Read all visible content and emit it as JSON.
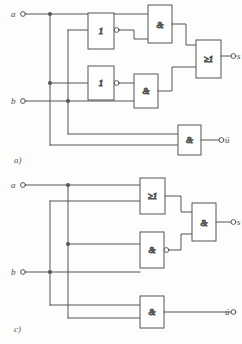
{
  "page": {
    "background_color": "#fdfdfc",
    "line_color": "#555555",
    "gate_fill": "#ffffff"
  },
  "figures": [
    {
      "id": "a",
      "caption": "a)",
      "inputs": [
        {
          "name": "input-a",
          "label": "a"
        },
        {
          "name": "input-b",
          "label": "b"
        }
      ],
      "outputs": [
        {
          "name": "output-s",
          "label": "s"
        },
        {
          "name": "output-ue",
          "label": "ü"
        }
      ],
      "gates": [
        {
          "name": "not-gate-1",
          "symbol": "1",
          "type": "NOT",
          "inverted_output": true
        },
        {
          "name": "and-gate-1",
          "symbol": "&",
          "type": "AND",
          "inverted_output": false
        },
        {
          "name": "not-gate-2",
          "symbol": "1",
          "type": "NOT",
          "inverted_output": true
        },
        {
          "name": "and-gate-2",
          "symbol": "&",
          "type": "AND",
          "inverted_output": false
        },
        {
          "name": "or-gate-1",
          "symbol": "≥1",
          "type": "OR",
          "inverted_output": false
        },
        {
          "name": "and-gate-3",
          "symbol": "&",
          "type": "AND",
          "inverted_output": false
        }
      ]
    },
    {
      "id": "c",
      "caption": "c)",
      "inputs": [
        {
          "name": "input-a",
          "label": "a"
        },
        {
          "name": "input-b",
          "label": "b"
        }
      ],
      "outputs": [
        {
          "name": "output-s",
          "label": "s"
        },
        {
          "name": "output-ue",
          "label": "ü"
        }
      ],
      "gates": [
        {
          "name": "or-gate-1",
          "symbol": "≥1",
          "type": "OR",
          "inverted_output": false
        },
        {
          "name": "nand-gate-1",
          "symbol": "&",
          "type": "NAND",
          "inverted_output": true
        },
        {
          "name": "and-gate-1",
          "symbol": "&",
          "type": "AND",
          "inverted_output": false
        },
        {
          "name": "and-gate-2",
          "symbol": "&",
          "type": "AND",
          "inverted_output": false
        }
      ]
    }
  ]
}
